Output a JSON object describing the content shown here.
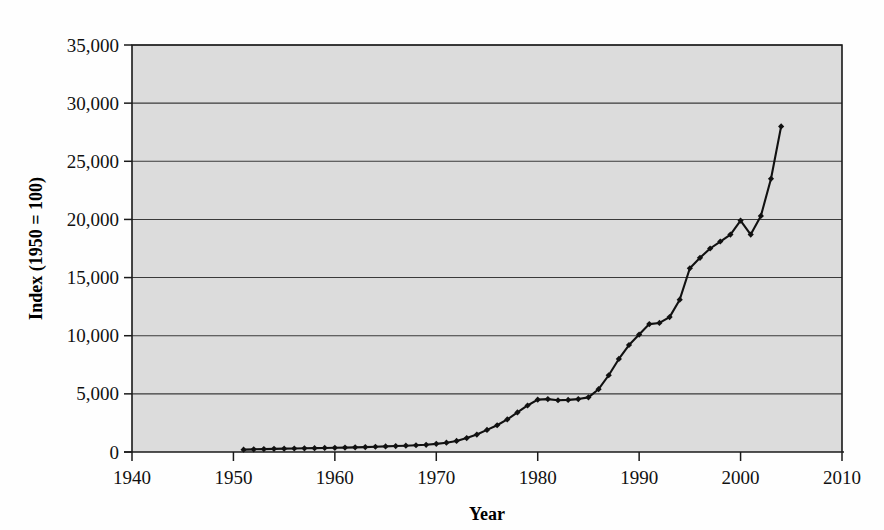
{
  "chart_data": {
    "type": "line",
    "title": "",
    "subtitle": "",
    "xlabel": "Year",
    "ylabel": "Index (1950 = 100)",
    "xlim": [
      1940,
      2010
    ],
    "ylim": [
      0,
      35000
    ],
    "xticks": [
      1940,
      1950,
      1960,
      1970,
      1980,
      1990,
      2000,
      2010
    ],
    "xtick_labels": [
      "1940",
      "1950",
      "1960",
      "1970",
      "1980",
      "1990",
      "2000",
      "2010"
    ],
    "yticks": [
      0,
      5000,
      10000,
      15000,
      20000,
      25000,
      30000,
      35000
    ],
    "ytick_labels": [
      "0",
      "5,000",
      "10,000",
      "15,000",
      "20,000",
      "25,000",
      "30,000",
      "35,000"
    ],
    "grid": true,
    "grid_axis": "y",
    "legend": false,
    "legend_position": "none",
    "plot_background": "#dcdcdc",
    "line_color": "#111111",
    "marker": "diamond",
    "series": [
      {
        "name": "Index (1950 = 100)",
        "x": [
          1951,
          1952,
          1953,
          1954,
          1955,
          1956,
          1957,
          1958,
          1959,
          1960,
          1961,
          1962,
          1963,
          1964,
          1965,
          1966,
          1967,
          1968,
          1969,
          1970,
          1971,
          1972,
          1973,
          1974,
          1975,
          1976,
          1977,
          1978,
          1979,
          1980,
          1981,
          1982,
          1983,
          1984,
          1985,
          1986,
          1987,
          1988,
          1989,
          1990,
          1991,
          1992,
          1993,
          1994,
          1995,
          1996,
          1997,
          1998,
          1999,
          2000,
          2001,
          2002,
          2003,
          2004
        ],
        "values": [
          200,
          230,
          250,
          270,
          290,
          300,
          320,
          330,
          350,
          360,
          380,
          400,
          420,
          450,
          480,
          510,
          540,
          580,
          620,
          700,
          800,
          950,
          1200,
          1500,
          1900,
          2300,
          2800,
          3400,
          4000,
          4500,
          4550,
          4450,
          4480,
          4550,
          4700,
          5400,
          6600,
          8000,
          9200,
          10100,
          11000,
          11100,
          11600,
          13100,
          15800,
          16700,
          17500,
          18100,
          18700,
          19900,
          18700,
          20300,
          23500,
          28000
        ]
      }
    ]
  }
}
